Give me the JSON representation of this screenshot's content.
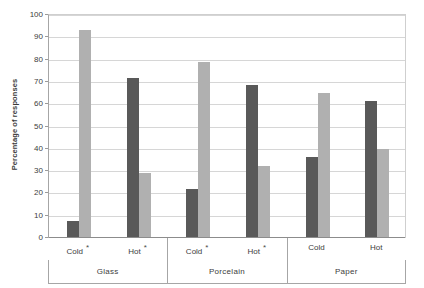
{
  "chart_data": {
    "type": "bar",
    "title": "",
    "xlabel": "",
    "ylabel": "Percentage of responses",
    "ylim": [
      0,
      100
    ],
    "ytick_step": 10,
    "yticks": [
      0,
      10,
      20,
      30,
      40,
      50,
      60,
      70,
      80,
      90,
      100
    ],
    "grid": true,
    "legend": "none",
    "groups": [
      "Glass",
      "Porcelain",
      "Paper"
    ],
    "categories": [
      "Cold",
      "Hot",
      "Cold",
      "Hot",
      "Cold",
      "Hot"
    ],
    "category_significance": [
      "*",
      "*",
      "*",
      "*",
      "",
      ""
    ],
    "series": [
      {
        "name": "dark",
        "color": "#595959",
        "values": [
          7,
          71.5,
          21.5,
          68,
          36,
          61
        ]
      },
      {
        "name": "light",
        "color": "#b0b0b0",
        "values": [
          93,
          28.5,
          78.5,
          32,
          64.5,
          39.5
        ]
      }
    ],
    "colors": {
      "dark_bar": "#595959",
      "light_bar": "#b0b0b0",
      "gridline": "#d6d6d6",
      "axis": "#a6a6a6",
      "background": "#ffffff",
      "text": "#3d3d3d"
    }
  },
  "axis": {
    "y_title": "Percentage of responses",
    "y_tick_labels": [
      "100",
      "90",
      "80",
      "70",
      "60",
      "50",
      "40",
      "30",
      "20",
      "10",
      "0"
    ]
  },
  "groups": [
    {
      "name": "Glass",
      "categories": [
        {
          "label": "Cold",
          "star": "*"
        },
        {
          "label": "Hot",
          "star": "*"
        }
      ]
    },
    {
      "name": "Porcelain",
      "categories": [
        {
          "label": "Cold",
          "star": "*"
        },
        {
          "label": "Hot",
          "star": "*"
        }
      ]
    },
    {
      "name": "Paper",
      "categories": [
        {
          "label": "Cold",
          "star": ""
        },
        {
          "label": "Hot",
          "star": ""
        }
      ]
    }
  ]
}
